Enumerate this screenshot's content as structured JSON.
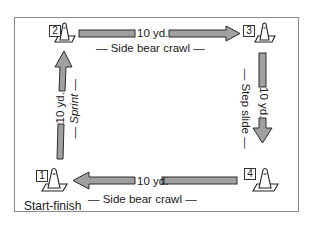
{
  "diagram": {
    "colors": {
      "arrow_fill": "#a0a0a0",
      "arrow_stroke": "#2a2a2a",
      "frame": "#8a8a8a",
      "cone_stroke": "#222222"
    },
    "cones": [
      {
        "id": "1",
        "label": "1",
        "caption": "Start-finish"
      },
      {
        "id": "2",
        "label": "2"
      },
      {
        "id": "3",
        "label": "3"
      },
      {
        "id": "4",
        "label": "4"
      }
    ],
    "legs": {
      "top": {
        "from": "2",
        "to": "3",
        "distance": "10 yd.",
        "activity": "Side bear crawl",
        "direction": "right"
      },
      "right": {
        "from": "3",
        "to": "4",
        "distance": "10 yd.",
        "activity": "Step slide",
        "direction": "down"
      },
      "bottom": {
        "from": "4",
        "to": "1",
        "distance": "10 yd.",
        "activity": "Side bear crawl",
        "direction": "left"
      },
      "left": {
        "from": "1",
        "to": "2",
        "distance": "10 yd.",
        "activity": "Sprint",
        "direction": "up"
      }
    },
    "dash": "—"
  }
}
